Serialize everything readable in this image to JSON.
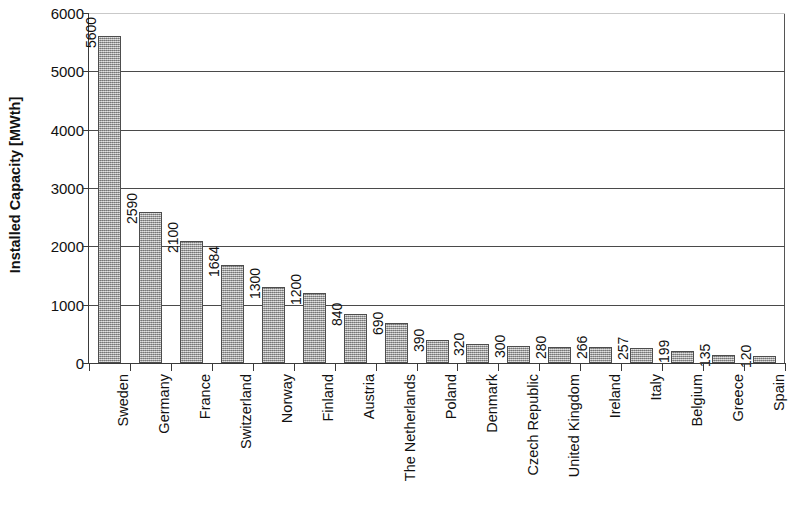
{
  "chart_data": {
    "type": "bar",
    "title": "",
    "subtitle": "",
    "xlabel": "",
    "ylabel": "Installed Capacity [MWth]",
    "ylim": [
      0,
      6000
    ],
    "ytick_values": [
      0,
      1000,
      2000,
      3000,
      4000,
      5000,
      6000
    ],
    "ytick_labels": [
      "0",
      "1000",
      "2000",
      "3000",
      "4000",
      "5000",
      "6000"
    ],
    "grid": true,
    "legend": "none",
    "orientation": "vertical",
    "bar_color": "#a3a3a3",
    "bar_border_color": "#4d4d4d",
    "axis_color": "#3a3a3a",
    "grid_color": "#4a4a4a",
    "categories": [
      "Sweden",
      "Germany",
      "France",
      "Switzerland",
      "Norway",
      "Finland",
      "Austria",
      "The Netherlands",
      "Poland",
      "Denmark",
      "Czech Republic",
      "United Kingdom",
      "Ireland",
      "Italy",
      "Belgium",
      "Greece",
      "Spain"
    ],
    "values": [
      5600,
      2590,
      2100,
      1684,
      1300,
      1200,
      840,
      690,
      390,
      320,
      300,
      280,
      266,
      257,
      199,
      135,
      120
    ],
    "value_labels": [
      "5600",
      "2590",
      "2100",
      "1684",
      "1300",
      "1200",
      "840",
      "690",
      "390",
      "320",
      "300",
      "280",
      "266",
      "257",
      "199",
      "135",
      "120"
    ],
    "data_labels_shown": true,
    "data_label_rotation": 90,
    "category_label_rotation": 90
  }
}
